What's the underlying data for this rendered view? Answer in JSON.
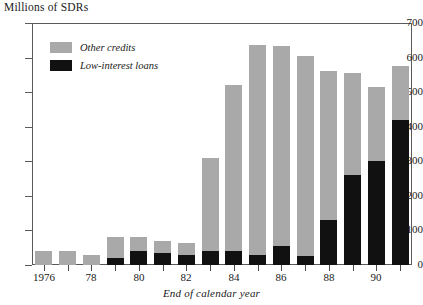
{
  "chart_data": {
    "type": "bar",
    "stacked": true,
    "title": "Millions of SDRs",
    "xlabel": "End of calendar year",
    "ylabel": "Millions of SDRs",
    "ylim": [
      0,
      700
    ],
    "ytick_values": [
      0,
      100,
      200,
      300,
      400,
      500,
      600,
      700
    ],
    "ytick_labels": [
      "0",
      "100",
      "200",
      "300",
      "400",
      "500",
      "600",
      "700"
    ],
    "grid": false,
    "legend_position": "top-left",
    "categories": [
      1976,
      1977,
      1978,
      1979,
      1980,
      1981,
      1982,
      1983,
      1984,
      1985,
      1986,
      1987,
      1988,
      1989,
      1990,
      1991
    ],
    "xtick_labels": [
      "1976",
      "78",
      "80",
      "82",
      "84",
      "86",
      "88",
      "90"
    ],
    "xtick_categories": [
      1976,
      1978,
      1980,
      1982,
      1984,
      1986,
      1988,
      1990
    ],
    "series": [
      {
        "name": "Low-interest loans",
        "color": "#111111",
        "values": [
          0,
          0,
          0,
          20,
          40,
          35,
          30,
          40,
          40,
          30,
          55,
          25,
          130,
          260,
          300,
          420
        ]
      },
      {
        "name": "Other credits",
        "color": "#a9a9a9",
        "values": [
          40,
          40,
          30,
          60,
          40,
          35,
          35,
          270,
          480,
          605,
          580,
          580,
          430,
          295,
          215,
          155
        ]
      }
    ],
    "totals": [
      40,
      40,
      30,
      80,
      80,
      70,
      65,
      310,
      520,
      635,
      635,
      605,
      560,
      555,
      515,
      575
    ]
  },
  "legend": {
    "items": [
      {
        "label": "Other credits",
        "swatch": "other-credits-swatch"
      },
      {
        "label": "Low-interest loans",
        "swatch": "low-interest-loans-swatch"
      }
    ]
  }
}
